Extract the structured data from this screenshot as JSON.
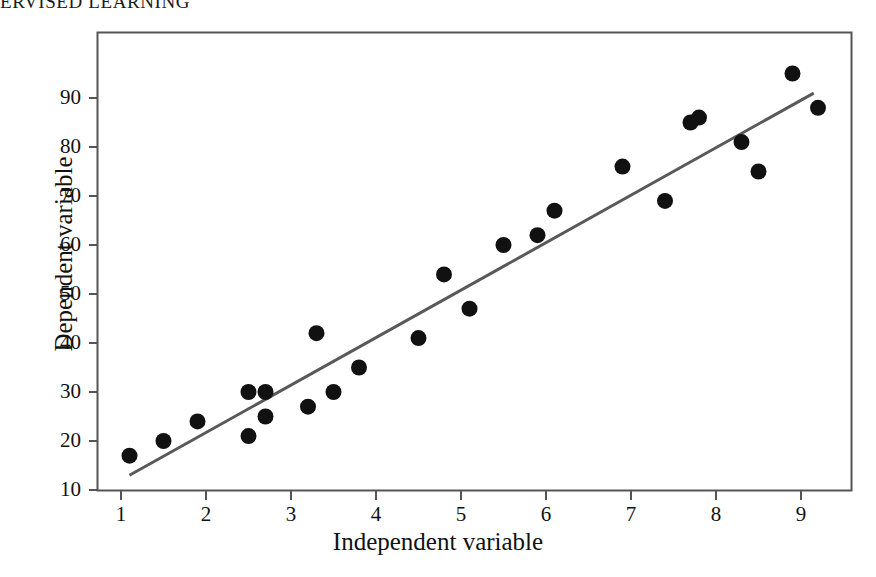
{
  "header": {
    "running_title": "ERVISED LEARNING"
  },
  "chart_data": {
    "type": "scatter",
    "title": "",
    "xlabel": "Independent variable",
    "ylabel": "Dependent variable",
    "xlim": [
      0.55,
      9.65
    ],
    "ylim": [
      7.5,
      97
    ],
    "xticks": [
      1,
      2,
      3,
      4,
      5,
      6,
      7,
      8,
      9
    ],
    "xtick_labels": [
      "1",
      "2",
      "3",
      "4",
      "5",
      "6",
      "7",
      "8",
      "9"
    ],
    "yticks": [
      10,
      20,
      30,
      40,
      50,
      60,
      70,
      80,
      90
    ],
    "ytick_labels": [
      "10",
      "20",
      "30",
      "40",
      "50",
      "60",
      "70",
      "80",
      "90"
    ],
    "grid": false,
    "legend": null,
    "marker": {
      "shape": "circle",
      "color": "#111111",
      "size_px": 16
    },
    "points": [
      {
        "x": 1.1,
        "y": 17
      },
      {
        "x": 1.5,
        "y": 20
      },
      {
        "x": 1.9,
        "y": 24
      },
      {
        "x": 2.5,
        "y": 30
      },
      {
        "x": 2.5,
        "y": 21
      },
      {
        "x": 2.7,
        "y": 30
      },
      {
        "x": 2.7,
        "y": 25
      },
      {
        "x": 3.2,
        "y": 27
      },
      {
        "x": 3.3,
        "y": 42
      },
      {
        "x": 3.5,
        "y": 30
      },
      {
        "x": 3.8,
        "y": 35
      },
      {
        "x": 4.5,
        "y": 41
      },
      {
        "x": 4.8,
        "y": 54
      },
      {
        "x": 5.1,
        "y": 47
      },
      {
        "x": 5.5,
        "y": 60
      },
      {
        "x": 5.9,
        "y": 62
      },
      {
        "x": 6.1,
        "y": 67
      },
      {
        "x": 6.9,
        "y": 76
      },
      {
        "x": 7.4,
        "y": 69
      },
      {
        "x": 7.7,
        "y": 85
      },
      {
        "x": 7.8,
        "y": 86
      },
      {
        "x": 8.3,
        "y": 81
      },
      {
        "x": 8.5,
        "y": 75
      },
      {
        "x": 8.9,
        "y": 95
      },
      {
        "x": 9.2,
        "y": 88
      }
    ],
    "trendline": {
      "type": "linear-fit",
      "color": "#595959",
      "width_px": 3,
      "x_start": 1.1,
      "y_start": 13,
      "x_end": 9.15,
      "y_end": 91
    },
    "axes_style": {
      "frame": true,
      "frame_color": "#555555",
      "tick_direction": "out"
    }
  }
}
